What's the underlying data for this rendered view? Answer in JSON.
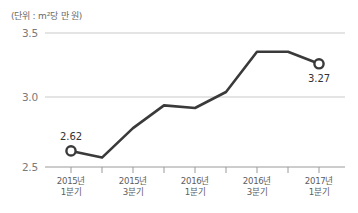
{
  "unit_note": "(단위 : m²당 만 원)",
  "axis": {
    "y_ticks": [
      "3.5",
      "3.0",
      "2.5"
    ],
    "x_ticks": [
      {
        "line1": "2015년",
        "line2": "1분기"
      },
      {
        "line1": "2015년",
        "line2": "3분기"
      },
      {
        "line1": "2016년",
        "line2": "1분기"
      },
      {
        "line1": "2016년",
        "line2": "3분기"
      },
      {
        "line1": "2017년",
        "line2": "1분기"
      }
    ]
  },
  "annotations": {
    "first_value": "2.62",
    "last_value": "3.27"
  },
  "colors": {
    "line": "#3a3a3a",
    "grid": "#c9c9c9",
    "axis": "#9a9a9a",
    "marker_fill": "#ffffff",
    "text": "#5d5d5d"
  },
  "chart_data": {
    "type": "line",
    "title": "",
    "subtitle": "",
    "xlabel": "",
    "ylabel": "(단위 : m²당 만 원)",
    "ylim": [
      2.5,
      3.5
    ],
    "yticks": [
      2.5,
      3.0,
      3.5
    ],
    "grid": true,
    "legend": false,
    "categories": [
      "2015년 1분기",
      "2015년 2분기",
      "2015년 3분기",
      "2015년 4분기",
      "2016년 1분기",
      "2016년 2분기",
      "2016년 3분기",
      "2016년 4분기",
      "2017년 1분기"
    ],
    "x": [
      0,
      1,
      2,
      3,
      4,
      5,
      6,
      7,
      8
    ],
    "values": [
      2.62,
      2.57,
      2.79,
      2.96,
      2.94,
      3.06,
      3.36,
      3.36,
      3.27
    ],
    "markers": [
      {
        "index": 0,
        "label": "2.62"
      },
      {
        "index": 8,
        "label": "3.27"
      }
    ],
    "annotations": [
      "2.62",
      "3.27"
    ]
  }
}
